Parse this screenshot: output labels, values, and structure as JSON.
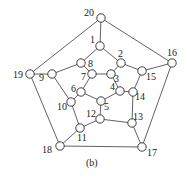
{
  "caption": "(b)",
  "nodes": [
    {
      "id": "1",
      "x": 100,
      "y": 46,
      "lx": 90,
      "ly": 43
    },
    {
      "id": "2",
      "x": 121,
      "y": 63,
      "lx": 118,
      "ly": 57
    },
    {
      "id": "3",
      "x": 111,
      "y": 74,
      "lx": 114,
      "ly": 82
    },
    {
      "id": "4",
      "x": 120,
      "y": 91,
      "lx": 110,
      "ly": 90
    },
    {
      "id": "5",
      "x": 101,
      "y": 101,
      "lx": 104,
      "ly": 110
    },
    {
      "id": "6",
      "x": 81,
      "y": 92,
      "lx": 71,
      "ly": 92
    },
    {
      "id": "7",
      "x": 92,
      "y": 74,
      "lx": 81,
      "ly": 80
    },
    {
      "id": "8",
      "x": 81,
      "y": 63,
      "lx": 88,
      "ly": 67
    },
    {
      "id": "9",
      "x": 52,
      "y": 74,
      "lx": 39,
      "ly": 81
    },
    {
      "id": "10",
      "x": 71,
      "y": 102,
      "lx": 57,
      "ly": 110
    },
    {
      "id": "11",
      "x": 80,
      "y": 128,
      "lx": 77,
      "ly": 141
    },
    {
      "id": "12",
      "x": 100,
      "y": 119,
      "lx": 86,
      "ly": 117
    },
    {
      "id": "13",
      "x": 132,
      "y": 123,
      "lx": 133,
      "ly": 120
    },
    {
      "id": "14",
      "x": 133,
      "y": 92,
      "lx": 135,
      "ly": 100
    },
    {
      "id": "15",
      "x": 142,
      "y": 71,
      "lx": 146,
      "ly": 80
    },
    {
      "id": "16",
      "x": 172,
      "y": 63,
      "lx": 167,
      "ly": 56
    },
    {
      "id": "17",
      "x": 142,
      "y": 147,
      "lx": 147,
      "ly": 156
    },
    {
      "id": "18",
      "x": 60,
      "y": 146,
      "lx": 42,
      "ly": 153
    },
    {
      "id": "19",
      "x": 30,
      "y": 74,
      "lx": 13,
      "ly": 78
    },
    {
      "id": "20",
      "x": 101,
      "y": 18,
      "lx": 84,
      "ly": 16
    }
  ],
  "edges": [
    [
      "20",
      "1"
    ],
    [
      "20",
      "19"
    ],
    [
      "20",
      "16"
    ],
    [
      "1",
      "8"
    ],
    [
      "1",
      "2"
    ],
    [
      "8",
      "9"
    ],
    [
      "8",
      "7"
    ],
    [
      "7",
      "3"
    ],
    [
      "7",
      "6"
    ],
    [
      "3",
      "2"
    ],
    [
      "3",
      "4"
    ],
    [
      "2",
      "15"
    ],
    [
      "15",
      "16"
    ],
    [
      "15",
      "14"
    ],
    [
      "4",
      "14"
    ],
    [
      "4",
      "5"
    ],
    [
      "5",
      "6"
    ],
    [
      "5",
      "12"
    ],
    [
      "6",
      "10"
    ],
    [
      "10",
      "9"
    ],
    [
      "10",
      "11"
    ],
    [
      "9",
      "19"
    ],
    [
      "19",
      "18"
    ],
    [
      "11",
      "18"
    ],
    [
      "11",
      "12"
    ],
    [
      "12",
      "13"
    ],
    [
      "13",
      "14"
    ],
    [
      "13",
      "17"
    ],
    [
      "17",
      "16"
    ],
    [
      "17",
      "18"
    ]
  ]
}
